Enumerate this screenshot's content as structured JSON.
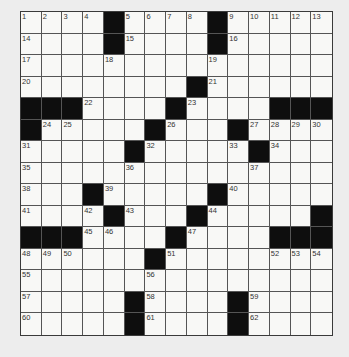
{
  "puzzle": {
    "rows": 15,
    "cols": 15,
    "layout": [
      "....#....#.....",
      "....#....#.....",
      "...............",
      "........#......",
      "###....#....###",
      "#.....#...#....",
      ".....#.....#...",
      "...............",
      "...#.....#.....",
      "....#...#.....#",
      "###....#....###",
      "......#........",
      "...............",
      ".....#....#....",
      ".....#....#...."
    ],
    "numbers": [
      {
        "n": "1",
        "r": 0,
        "c": 0
      },
      {
        "n": "2",
        "r": 0,
        "c": 1
      },
      {
        "n": "3",
        "r": 0,
        "c": 2
      },
      {
        "n": "4",
        "r": 0,
        "c": 3
      },
      {
        "n": "5",
        "r": 0,
        "c": 5
      },
      {
        "n": "6",
        "r": 0,
        "c": 6
      },
      {
        "n": "7",
        "r": 0,
        "c": 7
      },
      {
        "n": "8",
        "r": 0,
        "c": 8
      },
      {
        "n": "9",
        "r": 0,
        "c": 10
      },
      {
        "n": "10",
        "r": 0,
        "c": 11
      },
      {
        "n": "11",
        "r": 0,
        "c": 12
      },
      {
        "n": "12",
        "r": 0,
        "c": 13
      },
      {
        "n": "13",
        "r": 0,
        "c": 14
      },
      {
        "n": "14",
        "r": 1,
        "c": 0
      },
      {
        "n": "15",
        "r": 1,
        "c": 5
      },
      {
        "n": "16",
        "r": 1,
        "c": 10
      },
      {
        "n": "17",
        "r": 2,
        "c": 0
      },
      {
        "n": "18",
        "r": 2,
        "c": 4
      },
      {
        "n": "19",
        "r": 2,
        "c": 9
      },
      {
        "n": "20",
        "r": 3,
        "c": 0
      },
      {
        "n": "21",
        "r": 3,
        "c": 9
      },
      {
        "n": "22",
        "r": 4,
        "c": 3
      },
      {
        "n": "23",
        "r": 4,
        "c": 8
      },
      {
        "n": "24",
        "r": 5,
        "c": 1
      },
      {
        "n": "25",
        "r": 5,
        "c": 2
      },
      {
        "n": "26",
        "r": 5,
        "c": 7
      },
      {
        "n": "27",
        "r": 5,
        "c": 11
      },
      {
        "n": "28",
        "r": 5,
        "c": 12
      },
      {
        "n": "29",
        "r": 5,
        "c": 13
      },
      {
        "n": "30",
        "r": 5,
        "c": 14
      },
      {
        "n": "31",
        "r": 6,
        "c": 0
      },
      {
        "n": "32",
        "r": 6,
        "c": 6
      },
      {
        "n": "33",
        "r": 6,
        "c": 10
      },
      {
        "n": "34",
        "r": 6,
        "c": 12
      },
      {
        "n": "35",
        "r": 7,
        "c": 0
      },
      {
        "n": "36",
        "r": 7,
        "c": 5
      },
      {
        "n": "37",
        "r": 7,
        "c": 11
      },
      {
        "n": "38",
        "r": 8,
        "c": 0
      },
      {
        "n": "39",
        "r": 8,
        "c": 4
      },
      {
        "n": "40",
        "r": 8,
        "c": 10
      },
      {
        "n": "41",
        "r": 9,
        "c": 0
      },
      {
        "n": "42",
        "r": 9,
        "c": 3
      },
      {
        "n": "43",
        "r": 9,
        "c": 5
      },
      {
        "n": "44",
        "r": 9,
        "c": 9
      },
      {
        "n": "45",
        "r": 10,
        "c": 3
      },
      {
        "n": "46",
        "r": 10,
        "c": 4
      },
      {
        "n": "47",
        "r": 10,
        "c": 8
      },
      {
        "n": "48",
        "r": 11,
        "c": 0
      },
      {
        "n": "49",
        "r": 11,
        "c": 1
      },
      {
        "n": "50",
        "r": 11,
        "c": 2
      },
      {
        "n": "51",
        "r": 11,
        "c": 7
      },
      {
        "n": "52",
        "r": 11,
        "c": 12
      },
      {
        "n": "53",
        "r": 11,
        "c": 13
      },
      {
        "n": "54",
        "r": 11,
        "c": 14
      },
      {
        "n": "55",
        "r": 12,
        "c": 0
      },
      {
        "n": "56",
        "r": 12,
        "c": 6
      },
      {
        "n": "57",
        "r": 13,
        "c": 0
      },
      {
        "n": "58",
        "r": 13,
        "c": 6
      },
      {
        "n": "59",
        "r": 13,
        "c": 11
      },
      {
        "n": "60",
        "r": 14,
        "c": 0
      },
      {
        "n": "61",
        "r": 14,
        "c": 6
      },
      {
        "n": "62",
        "r": 14,
        "c": 11
      }
    ],
    "colors": {
      "black_square": "#0e0e0e",
      "white_square": "#f8f8f6",
      "grid_line": "#555555",
      "page_background": "#ededed"
    }
  }
}
